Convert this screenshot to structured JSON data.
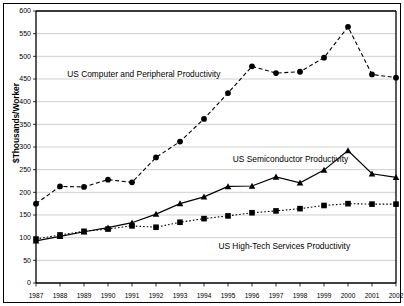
{
  "chart_data": {
    "type": "line",
    "title": "",
    "xlabel": "",
    "ylabel": "$Thousands/Worker",
    "ylim": [
      0,
      600
    ],
    "ytick_step": 50,
    "yticks": [
      0,
      50,
      100,
      150,
      200,
      250,
      300,
      350,
      400,
      450,
      500,
      550,
      600
    ],
    "grid": true,
    "legend_position": "inline-annotations",
    "categories": [
      1987,
      1988,
      1989,
      1990,
      1991,
      1992,
      1993,
      1994,
      1995,
      1996,
      1997,
      1998,
      1999,
      2000,
      2001,
      2002
    ],
    "x_tick_labels": [
      "1987",
      "1988",
      "1989",
      "1990",
      "1991",
      "1992",
      "1993",
      "1994",
      "1995",
      "1996",
      "1997",
      "1998",
      "1999",
      "2000",
      "2001",
      "2002"
    ],
    "series": [
      {
        "name": "US Computer and Peripheral Productivity",
        "marker": "circle",
        "line_style": "dashed",
        "color": "#000000",
        "values": [
          175,
          213,
          212,
          228,
          222,
          277,
          312,
          362,
          419,
          478,
          463,
          466,
          497,
          565,
          460,
          453
        ]
      },
      {
        "name": "US Semiconductor Productivity",
        "marker": "triangle",
        "line_style": "solid",
        "color": "#000000",
        "values": [
          93,
          103,
          113,
          122,
          133,
          152,
          175,
          190,
          213,
          214,
          234,
          221,
          249,
          292,
          241,
          233
        ]
      },
      {
        "name": "US High-Tech Services Productivity",
        "marker": "square",
        "line_style": "dotted",
        "color": "#000000",
        "values": [
          97,
          106,
          114,
          119,
          126,
          123,
          134,
          142,
          148,
          155,
          159,
          164,
          171,
          175,
          174,
          174
        ]
      }
    ],
    "annotations": [
      {
        "text": "US Computer and Peripheral Productivity",
        "x_index": 1.3,
        "y_value": 455
      },
      {
        "text": "US Semiconductor Productivity",
        "x_index": 8.2,
        "y_value": 268
      },
      {
        "text": "US High-Tech Services Productivity",
        "x_index": 7.6,
        "y_value": 75
      }
    ]
  }
}
